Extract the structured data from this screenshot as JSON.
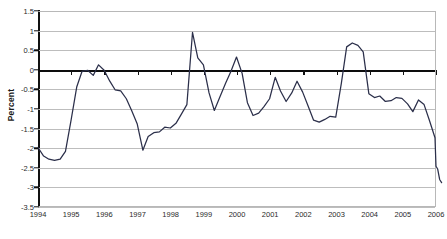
{
  "chart_data": {
    "type": "line",
    "title": "",
    "subtitle": "",
    "xlabel": "",
    "ylabel": "Percent",
    "xlim": [
      1994,
      2006
    ],
    "ylim": [
      -3.5,
      1.5
    ],
    "grid": true,
    "legend": null,
    "legend_position": "none",
    "y_ticks": [
      1.5,
      1,
      0.5,
      0,
      -0.5,
      -1,
      -1.5,
      -2,
      -2.5,
      -3,
      -3.5
    ],
    "y_tick_labels": [
      "1.5",
      "1",
      "0.5",
      "0",
      "-0.5",
      "-1",
      "-1.5",
      "-2",
      "-2.5",
      "-3",
      "-3.5"
    ],
    "x_ticks": [
      1994,
      1995,
      1996,
      1997,
      1998,
      1999,
      2000,
      2001,
      2002,
      2003,
      2004,
      2005,
      2006
    ],
    "x_tick_labels": [
      "1994",
      "1995",
      "1996",
      "1997",
      "1998",
      "1999",
      "2000",
      "2001",
      "2002",
      "2003",
      "2004",
      "2005",
      "2006"
    ],
    "series": [
      {
        "name": "Percent",
        "color": "#2b2f4a",
        "x": [
          1994.0,
          1994.17,
          1994.33,
          1994.5,
          1994.67,
          1994.83,
          1995.0,
          1995.17,
          1995.33,
          1995.5,
          1995.67,
          1995.83,
          1996.0,
          1996.17,
          1996.33,
          1996.5,
          1996.67,
          1996.83,
          1997.0,
          1997.17,
          1997.33,
          1997.5,
          1997.67,
          1997.83,
          1998.0,
          1998.17,
          1998.33,
          1998.5,
          1998.67,
          1998.83,
          1999.0,
          1999.17,
          1999.33,
          1999.5,
          1999.67,
          1999.83,
          2000.0,
          2000.17,
          2000.33,
          2000.5,
          2000.67,
          2000.83,
          2001.0,
          2001.17,
          2001.33,
          2001.5,
          2001.67,
          2001.83,
          2002.0,
          2002.17,
          2002.33,
          2002.5,
          2002.67,
          2002.83,
          2003.0,
          2003.17,
          2003.33,
          2003.5,
          2003.67,
          2003.83,
          2004.0,
          2004.17,
          2004.33,
          2004.5,
          2004.67,
          2004.83,
          2005.0,
          2005.17,
          2005.33,
          2005.5,
          2005.67,
          2005.83,
          2006.0
        ],
        "values": [
          -2.0,
          -2.22,
          -2.3,
          -2.33,
          -2.3,
          -2.1,
          -1.3,
          -0.45,
          -0.05,
          -0.02,
          -0.15,
          0.12,
          -0.02,
          -0.3,
          -0.52,
          -0.55,
          -0.75,
          -1.05,
          -1.4,
          -2.07,
          -1.72,
          -1.62,
          -1.6,
          -1.48,
          -1.5,
          -1.38,
          -1.15,
          -0.9,
          0.95,
          0.3,
          0.12,
          -0.6,
          -1.05,
          -0.7,
          -0.35,
          -0.05,
          0.32,
          -0.1,
          -0.85,
          -1.18,
          -1.12,
          -0.95,
          -0.75,
          -0.2,
          -0.55,
          -0.82,
          -0.6,
          -0.3,
          -0.58,
          -0.95,
          -1.3,
          -1.35,
          -1.28,
          -1.2,
          -1.22,
          -0.35,
          0.58,
          0.68,
          0.62,
          0.45,
          -0.62,
          -0.72,
          -0.68,
          -0.82,
          -0.8,
          -0.72,
          -0.74,
          -0.88,
          -1.08,
          -0.78,
          -0.9,
          -1.3,
          -1.75
        ],
        "extra_tail_x": [
          2006.03,
          2006.08,
          2006.14,
          2006.2
        ],
        "extra_tail_values": [
          -2.48,
          -2.55,
          -2.82,
          -2.9
        ]
      }
    ],
    "annotations": []
  },
  "axis_style": {
    "gridline_color": "#bdbdbd",
    "zero_line_color": "#0d0d0d",
    "spine_color": "#111111",
    "series_color": "#2b2f4a",
    "background": "#ffffff"
  }
}
